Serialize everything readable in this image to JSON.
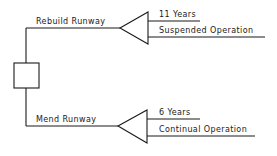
{
  "diagram": {
    "type": "decision-tree",
    "decision_node": {
      "shape": "square"
    },
    "branches": [
      {
        "label": "Rebuild Runway",
        "outcomes": [
          "11 Years",
          "Suspended Operation"
        ]
      },
      {
        "label": "Mend Runway",
        "outcomes": [
          "6 Years",
          "Continual Operation"
        ]
      }
    ],
    "colors": {
      "line": "#1a1a1a",
      "background": "#ffffff"
    }
  }
}
